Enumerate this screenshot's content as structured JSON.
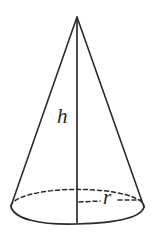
{
  "figure": {
    "kind": "cone-diagram",
    "background_color": "#ffffff",
    "stroke_color": "#2b2b2b",
    "label_color": "#262626",
    "canvas": {
      "width": 155,
      "height": 238
    },
    "labels": {
      "height": "h",
      "radius": "r"
    },
    "geometry": {
      "apex": {
        "x": 77,
        "y": 17
      },
      "base_center": {
        "x": 77,
        "y": 207
      },
      "base_rx": 66,
      "base_ry": 17,
      "left_base_point": {
        "x": 11,
        "y": 206
      },
      "right_base_point": {
        "x": 144,
        "y": 207
      },
      "height_line_bottom": {
        "x": 77,
        "y": 223
      },
      "radius_line_end": {
        "x": 141,
        "y": 200
      }
    },
    "labels_position": {
      "height": {
        "x": 57,
        "y": 123
      },
      "radius": {
        "x": 103,
        "y": 204
      }
    },
    "stroke_widths": {
      "outline": 1.6,
      "height_line": 1.6,
      "dashed": 1.5
    },
    "dash_pattern": "4 3"
  }
}
